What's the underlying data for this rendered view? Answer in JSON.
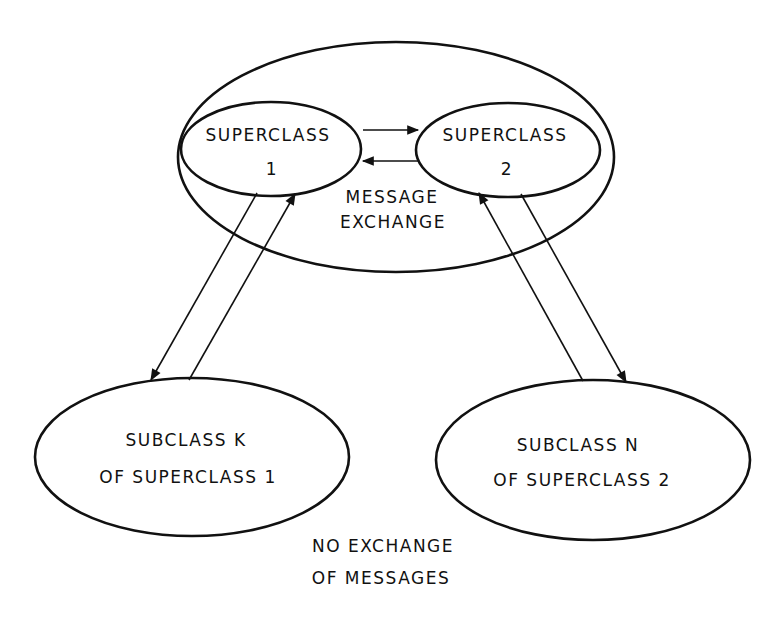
{
  "diagram": {
    "container": {
      "label": ""
    },
    "nodes": [
      {
        "id": "superclass-1",
        "line1": "SUPERCLASS",
        "line2": "1"
      },
      {
        "id": "superclass-2",
        "line1": "SUPERCLASS",
        "line2": "2"
      },
      {
        "id": "subclass-k",
        "line1": "SUBCLASS  K",
        "line2": "OF SUPERCLASS 1"
      },
      {
        "id": "subclass-n",
        "line1": "SUBCLASS  N",
        "line2": "OF SUPERCLASS 2"
      }
    ],
    "annotations": {
      "message_exchange": {
        "line1": "MESSAGE",
        "line2": "EXCHANGE"
      },
      "no_exchange": {
        "line1": "NO EXCHANGE",
        "line2": "OF MESSAGES"
      }
    },
    "edges": [
      {
        "from": "superclass-1",
        "to": "superclass-2"
      },
      {
        "from": "superclass-2",
        "to": "superclass-1"
      },
      {
        "from": "superclass-1",
        "to": "subclass-k"
      },
      {
        "from": "subclass-k",
        "to": "superclass-1"
      },
      {
        "from": "superclass-2",
        "to": "subclass-n"
      },
      {
        "from": "subclass-n",
        "to": "superclass-2"
      }
    ],
    "colors": {
      "stroke": "#111111",
      "background": "#ffffff"
    }
  }
}
